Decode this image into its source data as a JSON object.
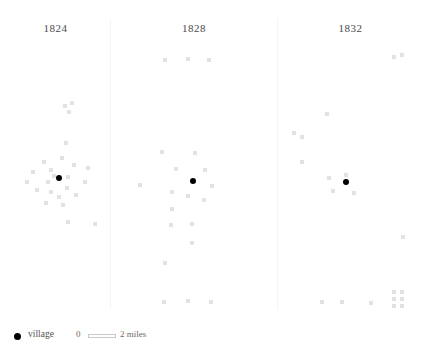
{
  "chart_data": {
    "type": "scatter",
    "title": "",
    "subtitle": "",
    "xlabel": "",
    "ylabel": "",
    "grid": false,
    "legend_position": "bottom-left",
    "panels": [
      {
        "label": "1824",
        "x0": 0,
        "width": 111,
        "village": {
          "x": 57,
          "y": 176
        },
        "houses": [
          {
            "x": 63,
            "y": 104
          },
          {
            "x": 70,
            "y": 101
          },
          {
            "x": 67,
            "y": 110
          },
          {
            "x": 64,
            "y": 141
          },
          {
            "x": 42,
            "y": 160
          },
          {
            "x": 60,
            "y": 156
          },
          {
            "x": 72,
            "y": 163
          },
          {
            "x": 31,
            "y": 170
          },
          {
            "x": 49,
            "y": 168
          },
          {
            "x": 52,
            "y": 174
          },
          {
            "x": 25,
            "y": 180
          },
          {
            "x": 46,
            "y": 180
          },
          {
            "x": 86,
            "y": 166
          },
          {
            "x": 66,
            "y": 175
          },
          {
            "x": 83,
            "y": 180
          },
          {
            "x": 35,
            "y": 188
          },
          {
            "x": 49,
            "y": 190
          },
          {
            "x": 65,
            "y": 186
          },
          {
            "x": 57,
            "y": 195
          },
          {
            "x": 74,
            "y": 193
          },
          {
            "x": 44,
            "y": 201
          },
          {
            "x": 61,
            "y": 203
          },
          {
            "x": 66,
            "y": 220
          },
          {
            "x": 93,
            "y": 222
          }
        ]
      },
      {
        "label": "1828",
        "x0": 111,
        "width": 166,
        "village": {
          "x": 191,
          "y": 179
        },
        "houses": [
          {
            "x": 163,
            "y": 58
          },
          {
            "x": 186,
            "y": 57
          },
          {
            "x": 207,
            "y": 58
          },
          {
            "x": 160,
            "y": 150
          },
          {
            "x": 193,
            "y": 151
          },
          {
            "x": 174,
            "y": 167
          },
          {
            "x": 203,
            "y": 168
          },
          {
            "x": 138,
            "y": 183
          },
          {
            "x": 210,
            "y": 184
          },
          {
            "x": 170,
            "y": 190
          },
          {
            "x": 186,
            "y": 194
          },
          {
            "x": 202,
            "y": 198
          },
          {
            "x": 170,
            "y": 207
          },
          {
            "x": 169,
            "y": 223
          },
          {
            "x": 190,
            "y": 222
          },
          {
            "x": 190,
            "y": 241
          },
          {
            "x": 163,
            "y": 261
          },
          {
            "x": 162,
            "y": 300
          },
          {
            "x": 186,
            "y": 299
          },
          {
            "x": 209,
            "y": 300
          }
        ]
      },
      {
        "label": "1832",
        "x0": 277,
        "width": 147,
        "village": {
          "x": 344,
          "y": 180
        },
        "houses": [
          {
            "x": 392,
            "y": 55
          },
          {
            "x": 400,
            "y": 53
          },
          {
            "x": 325,
            "y": 112
          },
          {
            "x": 292,
            "y": 131
          },
          {
            "x": 300,
            "y": 135
          },
          {
            "x": 300,
            "y": 160
          },
          {
            "x": 327,
            "y": 176
          },
          {
            "x": 344,
            "y": 173
          },
          {
            "x": 331,
            "y": 189
          },
          {
            "x": 352,
            "y": 191
          },
          {
            "x": 401,
            "y": 235
          },
          {
            "x": 320,
            "y": 300
          },
          {
            "x": 340,
            "y": 300
          },
          {
            "x": 369,
            "y": 301
          },
          {
            "x": 392,
            "y": 290
          },
          {
            "x": 400,
            "y": 290
          },
          {
            "x": 392,
            "y": 297
          },
          {
            "x": 400,
            "y": 297
          },
          {
            "x": 392,
            "y": 304
          },
          {
            "x": 400,
            "y": 304
          }
        ]
      }
    ],
    "dividers": [
      110,
      277
    ],
    "legend": {
      "village_label": "village",
      "scale_min": "0",
      "scale_max": "2 miles"
    },
    "colors": {
      "village": "#000000",
      "house": "#e2e2e2",
      "divider": "#f4f4f4",
      "title_text": "#4a4a4a",
      "legend_text": "#55524e",
      "background": "#ffffff"
    }
  }
}
